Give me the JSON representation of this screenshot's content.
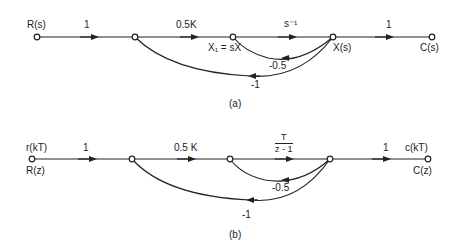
{
  "diagram_a": {
    "caption": "(a)",
    "nodes": {
      "input": "R(s)",
      "x1": "X₁ = sX",
      "x": "X(s)",
      "output": "C(s)"
    },
    "branch_gains": {
      "r_to_n2": "1",
      "n2_to_x1": "0.5K",
      "x1_to_x": "s⁻¹",
      "x_to_c": "1",
      "x_to_x1_feedback": "-0.5",
      "x_to_n2_feedback": "-1"
    }
  },
  "diagram_b": {
    "caption": "(b)",
    "nodes": {
      "input_top": "r(kT)",
      "input_bottom": "R(z)",
      "output_top": "c(kT)",
      "output_bottom": "C(z)"
    },
    "branch_gains": {
      "r_to_n2": "1",
      "n2_to_n3": "0.5 K",
      "n3_to_n4_num": "T",
      "n3_to_n4_den": "z - 1",
      "n4_to_c": "1",
      "n4_to_n3_feedback": "-0.5",
      "n4_to_n2_feedback": "-1"
    }
  }
}
